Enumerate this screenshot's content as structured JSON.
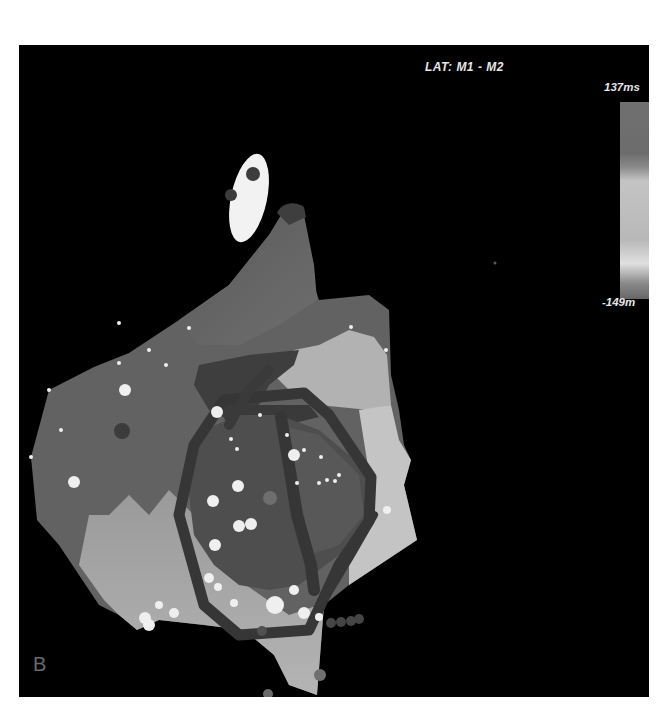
{
  "figure": {
    "panel_label": "B",
    "map_title": "LAT: M1 - M2",
    "colorbar": {
      "max_label": "137ms",
      "min_label": "-149m",
      "max_value_ms": 137,
      "min_value_ms": -149,
      "gradient_colors": [
        "#707070",
        "#8a8a8a",
        "#c4c4c4",
        "#b8b8b8",
        "#e0e0e0",
        "#666666"
      ]
    },
    "background_color": "#000000"
  }
}
